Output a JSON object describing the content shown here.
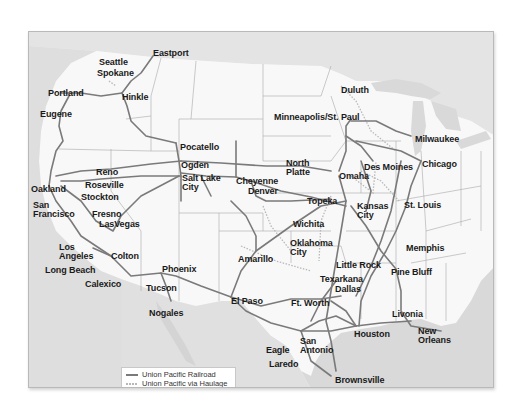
{
  "map": {
    "title": "Union Pacific Railroad System Map",
    "colors": {
      "land": "#f7f7f7",
      "frame_bg": "#f1f1f1",
      "water": "#d9d9d9",
      "mexico": "#e0e0e0",
      "canada": "#e4e4e4",
      "state_border": "#a8a8a8",
      "rail_line": "#7a7a7a",
      "haulage_line": "#b8b8b8",
      "label": "#1a1a1a"
    },
    "cities": [
      {
        "name": "Eastport",
        "x": 152,
        "y": 48
      },
      {
        "name": "Seattle",
        "x": 98,
        "y": 57
      },
      {
        "name": "Spokane",
        "x": 96,
        "y": 68
      },
      {
        "name": "Portland",
        "x": 47,
        "y": 88
      },
      {
        "name": "Hinkle",
        "x": 121,
        "y": 92
      },
      {
        "name": "Eugene",
        "x": 39,
        "y": 109
      },
      {
        "name": "Duluth",
        "x": 340,
        "y": 85
      },
      {
        "name": "Minneapolis/St. Paul",
        "x": 273,
        "y": 112
      },
      {
        "name": "Milwaukee",
        "x": 414,
        "y": 134
      },
      {
        "name": "Pocatello",
        "x": 179,
        "y": 142
      },
      {
        "name": "North Platte",
        "x": 285,
        "y": 158
      },
      {
        "name": "Des Moines",
        "x": 363,
        "y": 162
      },
      {
        "name": "Chicago",
        "x": 421,
        "y": 159
      },
      {
        "name": "Reno",
        "x": 95,
        "y": 167
      },
      {
        "name": "Ogden",
        "x": 180,
        "y": 160
      },
      {
        "name": "Omaha",
        "x": 338,
        "y": 171
      },
      {
        "name": "Salt Lake City",
        "x": 181,
        "y": 173
      },
      {
        "name": "Cheyenne",
        "x": 235,
        "y": 176
      },
      {
        "name": "Oakland",
        "x": 30,
        "y": 184
      },
      {
        "name": "Roseville",
        "x": 84,
        "y": 180
      },
      {
        "name": "Denver",
        "x": 247,
        "y": 186
      },
      {
        "name": "Topeka",
        "x": 306,
        "y": 196
      },
      {
        "name": "San Francisco",
        "x": 32,
        "y": 200
      },
      {
        "name": "Stockton",
        "x": 80,
        "y": 192
      },
      {
        "name": "St. Louis",
        "x": 403,
        "y": 200
      },
      {
        "name": "Kansas City",
        "x": 356,
        "y": 201
      },
      {
        "name": "Fresno",
        "x": 91,
        "y": 209
      },
      {
        "name": "LasVegas",
        "x": 98,
        "y": 219
      },
      {
        "name": "Wichita",
        "x": 292,
        "y": 219
      },
      {
        "name": "Oklahoma City",
        "x": 289,
        "y": 238
      },
      {
        "name": "Memphis",
        "x": 405,
        "y": 243
      },
      {
        "name": "Los Angeles",
        "x": 58,
        "y": 242
      },
      {
        "name": "Colton",
        "x": 110,
        "y": 251
      },
      {
        "name": "Amarillo",
        "x": 237,
        "y": 254
      },
      {
        "name": "Little Rock",
        "x": 335,
        "y": 260
      },
      {
        "name": "Long Beach",
        "x": 44,
        "y": 265
      },
      {
        "name": "Phoenix",
        "x": 161,
        "y": 264
      },
      {
        "name": "Pine Bluff",
        "x": 390,
        "y": 267
      },
      {
        "name": "Texarkana",
        "x": 319,
        "y": 274
      },
      {
        "name": "Calexico",
        "x": 84,
        "y": 279
      },
      {
        "name": "Tucson",
        "x": 145,
        "y": 283
      },
      {
        "name": "Dallas",
        "x": 334,
        "y": 284
      },
      {
        "name": "El Paso",
        "x": 230,
        "y": 296
      },
      {
        "name": "Ft. Worth",
        "x": 290,
        "y": 298
      },
      {
        "name": "Livonia",
        "x": 391,
        "y": 309
      },
      {
        "name": "Nogales",
        "x": 148,
        "y": 308
      },
      {
        "name": "New Orleans",
        "x": 417,
        "y": 326
      },
      {
        "name": "Houston",
        "x": 353,
        "y": 329
      },
      {
        "name": "San Antonio",
        "x": 299,
        "y": 336
      },
      {
        "name": "Eagle",
        "x": 265,
        "y": 345
      },
      {
        "name": "Laredo",
        "x": 268,
        "y": 359
      },
      {
        "name": "Brownsville",
        "x": 334,
        "y": 375
      }
    ]
  },
  "legend": {
    "items": [
      {
        "label": "Union Pacific Railroad",
        "style": "solid"
      },
      {
        "label": "Union Pacific via Haulage",
        "style": "dotted"
      },
      {
        "label": "or Trackage Rights",
        "style": "none"
      }
    ]
  }
}
